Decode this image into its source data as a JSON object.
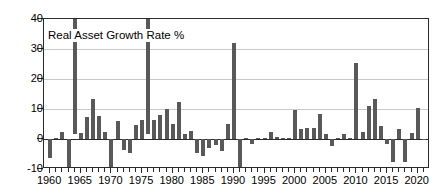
{
  "chart_data": {
    "type": "bar",
    "title": "Real Asset Growth Rate %",
    "xlabel": "",
    "ylabel": "",
    "ylim": [
      -10,
      40
    ],
    "xlim": [
      1959,
      2022
    ],
    "grid": true,
    "legend": "none",
    "yticks": [
      40,
      30,
      20,
      10,
      0,
      -10
    ],
    "ytick_labels": [
      "40",
      "30",
      "20",
      "10",
      "0",
      "-10"
    ],
    "xticks": [
      1960,
      1965,
      1970,
      1975,
      1980,
      1985,
      1990,
      1995,
      2000,
      2005,
      2010,
      2015,
      2020
    ],
    "xtick_labels": [
      "1960",
      "1965",
      "1970",
      "1975",
      "1980",
      "1985",
      "1990",
      "1995",
      "2000",
      "2005",
      "2010",
      "2015",
      "2020"
    ],
    "note": "Bars for 1964 and 1976 exceed the top of the plotted range and are clipped at 40.",
    "categories": [
      1960,
      1961,
      1962,
      1963,
      1964,
      1965,
      1966,
      1967,
      1968,
      1969,
      1970,
      1971,
      1972,
      1973,
      1974,
      1975,
      1976,
      1977,
      1978,
      1979,
      1980,
      1981,
      1982,
      1983,
      1984,
      1985,
      1986,
      1987,
      1988,
      1989,
      1990,
      1991,
      1992,
      1993,
      1994,
      1995,
      1996,
      1997,
      1998,
      1999,
      2000,
      2001,
      2002,
      2003,
      2004,
      2005,
      2006,
      2007,
      2008,
      2009,
      2010,
      2011,
      2012,
      2013,
      2014,
      2015,
      2016,
      2017,
      2018,
      2019,
      2020,
      2021
    ],
    "values": [
      -6.2,
      0.4,
      2.5,
      -9.3,
      44.0,
      2.0,
      7.5,
      13.2,
      7.8,
      2.2,
      -10.2,
      6.0,
      -3.8,
      -4.5,
      4.8,
      6.2,
      43.0,
      6.5,
      8.0,
      10.0,
      5.0,
      12.3,
      1.8,
      2.6,
      -4.8,
      -5.8,
      -3.0,
      -2.0,
      -4.0,
      5.0,
      32.0,
      -9.5,
      0.3,
      -1.8,
      0.2,
      0.2,
      2.2,
      0.6,
      0.4,
      0.2,
      9.8,
      3.4,
      3.6,
      3.8,
      8.2,
      1.6,
      -2.2,
      0.3,
      1.6,
      0.2,
      25.3,
      2.5,
      11.0,
      13.5,
      4.5,
      -1.5,
      -7.8,
      3.2,
      -7.5,
      2.0,
      10.2,
      0.1
    ],
    "series_name": "Real Asset Growth Rate %",
    "bar_color": "#595959"
  }
}
